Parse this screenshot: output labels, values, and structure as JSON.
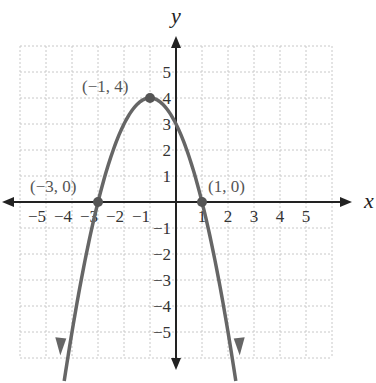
{
  "chart_data": {
    "type": "line",
    "title": "",
    "xlabel": "x",
    "ylabel": "y",
    "xlim": [
      -6,
      6
    ],
    "ylim": [
      -6,
      6
    ],
    "grid": true,
    "function": "y = -(x+1)^2 + 4",
    "x_ticks": [
      "-5",
      "-4",
      "-3",
      "-2",
      "-1",
      "1",
      "2",
      "3",
      "4",
      "5"
    ],
    "y_ticks": [
      "5",
      "4",
      "3",
      "2",
      "1",
      "-1",
      "-2",
      "-3",
      "-4",
      "-5"
    ],
    "series": [
      {
        "name": "parabola",
        "x": [
          -4.4,
          -3,
          -2,
          -1,
          0,
          1,
          2.4
        ],
        "y": [
          -7.56,
          0,
          3,
          4,
          3,
          0,
          -7.56
        ]
      }
    ],
    "points": [
      {
        "x": -1,
        "y": 4,
        "label": "(−1, 4)"
      },
      {
        "x": -3,
        "y": 0,
        "label": "(−3, 0)"
      },
      {
        "x": 1,
        "y": 0,
        "label": "(1, 0)"
      }
    ]
  },
  "labels": {
    "x_axis": "x",
    "y_axis": "y",
    "vertex": "(−1, 4)",
    "left_root": "(−3, 0)",
    "right_root": "(1, 0)"
  }
}
